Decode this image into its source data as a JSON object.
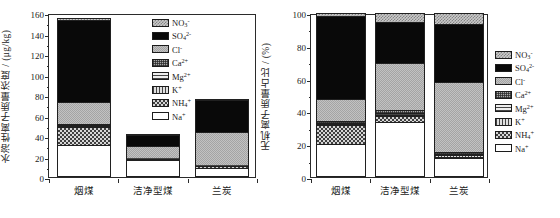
{
  "figure": {
    "panels": [
      "left",
      "right"
    ],
    "categories": [
      "烟煤",
      "洁净型煤",
      "兰炭"
    ]
  },
  "legend": {
    "items": [
      {
        "key": "NO3",
        "label": "NO",
        "sub": "3",
        "sup": "-",
        "swatch": "f-no3"
      },
      {
        "key": "SO4",
        "label": "SO",
        "sub": "4",
        "sup": "2-",
        "swatch": "f-so4"
      },
      {
        "key": "Cl",
        "label": "Cl",
        "sub": "",
        "sup": "-",
        "swatch": "f-cl"
      },
      {
        "key": "Ca",
        "label": "Ca",
        "sub": "",
        "sup": "2+",
        "swatch": "f-ca"
      },
      {
        "key": "Mg",
        "label": "Mg",
        "sub": "",
        "sup": "2+",
        "swatch": "f-mg"
      },
      {
        "key": "K",
        "label": "K",
        "sub": "",
        "sup": "+",
        "swatch": "f-k"
      },
      {
        "key": "NH4",
        "label": "NH",
        "sub": "4",
        "sup": "+",
        "swatch": "f-nh4"
      },
      {
        "key": "Na",
        "label": "Na",
        "sub": "",
        "sup": "+",
        "swatch": "f-na"
      }
    ]
  },
  "chart_data": [
    {
      "id": "left",
      "type": "bar",
      "stacked": true,
      "title": "",
      "xlabel": "",
      "ylabel": "水溶性离子质量浓度 / (μg/kg)",
      "ylim": [
        0,
        160
      ],
      "yticks": [
        0,
        20,
        40,
        60,
        80,
        100,
        120,
        140,
        160
      ],
      "ytick_labels": [
        "0",
        "20",
        "40",
        "60",
        "80",
        "100",
        "120",
        "140",
        "160"
      ],
      "grid": false,
      "legend_position": "upper-right",
      "categories": [
        "烟煤",
        "洁净型煤",
        "兰炭"
      ],
      "series": [
        {
          "name": "Na+",
          "values": [
            31.0,
            16.5,
            9.0
          ]
        },
        {
          "name": "NH4+",
          "values": [
            18.0,
            1.0,
            1.5
          ]
        },
        {
          "name": "K+",
          "values": [
            0.8,
            0.4,
            0.6
          ]
        },
        {
          "name": "Mg2+",
          "values": [
            0.6,
            0.3,
            0.4
          ]
        },
        {
          "name": "Ca2+",
          "values": [
            1.6,
            0.8,
            0.5
          ]
        },
        {
          "name": "Cl-",
          "values": [
            21.0,
            11.0,
            32.0
          ]
        },
        {
          "name": "SO42-",
          "values": [
            80.0,
            11.0,
            31.0
          ]
        },
        {
          "name": "NO3-",
          "values": [
            2.0,
            1.0,
            1.0
          ]
        }
      ],
      "totals": [
        155.0,
        42.0,
        76.0
      ]
    },
    {
      "id": "right",
      "type": "bar",
      "stacked": true,
      "title": "",
      "xlabel": "",
      "ylabel": "无机离子质量占比 / (%)",
      "ylim": [
        0,
        100
      ],
      "yticks": [
        0,
        20,
        40,
        60,
        80,
        100
      ],
      "ytick_labels": [
        "0",
        "20",
        "40",
        "60",
        "80",
        "100"
      ],
      "grid": false,
      "legend_position": "outside-right",
      "categories": [
        "烟煤",
        "洁净型煤",
        "兰炭"
      ],
      "series": [
        {
          "name": "Na+",
          "values": [
            20.0,
            33.5,
            11.5
          ]
        },
        {
          "name": "NH4+",
          "values": [
            11.8,
            3.5,
            1.0
          ]
        },
        {
          "name": "K+",
          "values": [
            0.6,
            1.0,
            0.8
          ]
        },
        {
          "name": "Mg2+",
          "values": [
            0.6,
            0.8,
            0.5
          ]
        },
        {
          "name": "Ca2+",
          "values": [
            1.0,
            2.2,
            1.2
          ]
        },
        {
          "name": "Cl-",
          "values": [
            13.5,
            28.5,
            43.0
          ]
        },
        {
          "name": "SO42-",
          "values": [
            50.5,
            25.0,
            35.5
          ]
        },
        {
          "name": "NO3-",
          "values": [
            2.0,
            5.5,
            6.5
          ]
        }
      ],
      "totals": [
        100.0,
        100.0,
        100.0
      ]
    }
  ]
}
